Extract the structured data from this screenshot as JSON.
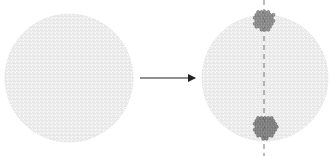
{
  "figure": {
    "width": 333,
    "height": 156,
    "background": "#ffffff",
    "left_sphere": {
      "cx": 69,
      "cy": 78,
      "r": 64,
      "bead_stroke": "#c8c8c8",
      "bead_fill": "#f4f4f4"
    },
    "arrow": {
      "x1": 140,
      "x2": 195,
      "y": 78,
      "color": "#222222"
    },
    "right_sphere": {
      "cx": 265,
      "cy": 78,
      "r": 63,
      "bead_stroke": "#c8c8c8",
      "bead_fill": "#f4f4f4"
    },
    "axis": {
      "x": 264,
      "y1": 0,
      "y2": 156,
      "color": "#777777",
      "dash": "5,4"
    },
    "clusters": [
      {
        "id": "top",
        "cx": 264,
        "cy": 20,
        "r": 11,
        "fill": "#9a9a9a",
        "stroke": "#555555"
      },
      {
        "id": "bottom",
        "cx": 265,
        "cy": 127,
        "r": 12,
        "fill": "#8e8e8e",
        "stroke": "#4a4a4a"
      }
    ]
  }
}
